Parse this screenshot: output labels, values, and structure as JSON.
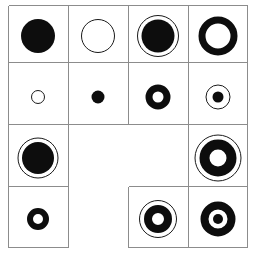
{
  "figure": {
    "background_color": "#ffffff",
    "line_color": "#8c8c8c",
    "ink_color": "#0d0d0d",
    "columns": 4,
    "rows": 4,
    "cell_width": 60,
    "cell_height": 61,
    "origin_x": 8,
    "origin_y": 5
  },
  "grid": {
    "segments_note": "Row 2 columns 1-2 merged blank; row 3 column 1 absent (notch)",
    "blank_cells": [
      "r2c1",
      "r2c2",
      "r3c1"
    ]
  },
  "cells": [
    {
      "id": "r0c0",
      "row": 0,
      "col": 0,
      "label": "filled-disc-large",
      "shapes": [
        {
          "kind": "disc",
          "diameter": 34,
          "color": "#0d0d0d"
        }
      ]
    },
    {
      "id": "r0c1",
      "row": 0,
      "col": 1,
      "label": "thin-outline-circle-large",
      "shapes": [
        {
          "kind": "ring-thin",
          "diameter": 34,
          "color": "#1a1a1a"
        }
      ]
    },
    {
      "id": "r0c2",
      "row": 0,
      "col": 2,
      "label": "filled-disc-with-outer-ring",
      "shapes": [
        {
          "kind": "ring-thin",
          "diameter": 42,
          "color": "#1a1a1a"
        },
        {
          "kind": "disc",
          "diameter": 33,
          "color": "#0d0d0d"
        }
      ]
    },
    {
      "id": "r0c3",
      "row": 0,
      "col": 3,
      "label": "thick-annulus-large",
      "shapes": [
        {
          "kind": "ring-thick",
          "diameter": 39,
          "thickness": 7,
          "color": "#0d0d0d"
        }
      ]
    },
    {
      "id": "r1c0",
      "row": 1,
      "col": 0,
      "label": "thin-outline-circle-small",
      "shapes": [
        {
          "kind": "ring-thin",
          "diameter": 14,
          "color": "#1a1a1a"
        }
      ]
    },
    {
      "id": "r1c1",
      "row": 1,
      "col": 1,
      "label": "filled-dot-small",
      "shapes": [
        {
          "kind": "disc",
          "diameter": 13,
          "color": "#0d0d0d"
        }
      ]
    },
    {
      "id": "r1c2",
      "row": 1,
      "col": 2,
      "label": "thick-annulus-small",
      "shapes": [
        {
          "kind": "ring-thick",
          "diameter": 25,
          "thickness": 7,
          "color": "#0d0d0d"
        }
      ]
    },
    {
      "id": "r1c3",
      "row": 1,
      "col": 3,
      "label": "dot-with-outer-ring",
      "shapes": [
        {
          "kind": "ring-thin",
          "diameter": 25,
          "color": "#1a1a1a"
        },
        {
          "kind": "dot",
          "diameter": 11,
          "color": "#0d0d0d"
        }
      ]
    },
    {
      "id": "r2c0",
      "row": 2,
      "col": 0,
      "label": "filled-disc-with-outer-ring",
      "shapes": [
        {
          "kind": "ring-thin",
          "diameter": 41,
          "color": "#1a1a1a"
        },
        {
          "kind": "disc",
          "diameter": 32,
          "color": "#0d0d0d"
        }
      ]
    },
    {
      "id": "r2c3",
      "row": 2,
      "col": 3,
      "label": "thick-annulus-with-outer-ring-large",
      "shapes": [
        {
          "kind": "ring-thin",
          "diameter": 47,
          "color": "#1a1a1a"
        },
        {
          "kind": "ring-thick",
          "diameter": 37,
          "thickness": 10,
          "color": "#0d0d0d"
        }
      ]
    },
    {
      "id": "r3c0",
      "row": 3,
      "col": 0,
      "label": "thick-annulus-small",
      "shapes": [
        {
          "kind": "ring-thick",
          "diameter": 22,
          "thickness": 6,
          "color": "#0d0d0d"
        }
      ]
    },
    {
      "id": "r3c2",
      "row": 3,
      "col": 2,
      "label": "thick-annulus-with-outer-ring",
      "shapes": [
        {
          "kind": "ring-thin",
          "diameter": 38,
          "color": "#1a1a1a"
        },
        {
          "kind": "ring-thick",
          "diameter": 28,
          "thickness": 8,
          "color": "#0d0d0d"
        }
      ]
    },
    {
      "id": "r3c3",
      "row": 3,
      "col": 3,
      "label": "bullseye-ring-with-center-dot",
      "shapes": [
        {
          "kind": "ring-thick",
          "diameter": 35,
          "thickness": 8,
          "color": "#0d0d0d"
        },
        {
          "kind": "dot",
          "diameter": 10,
          "color": "#0d0d0d"
        }
      ]
    }
  ]
}
